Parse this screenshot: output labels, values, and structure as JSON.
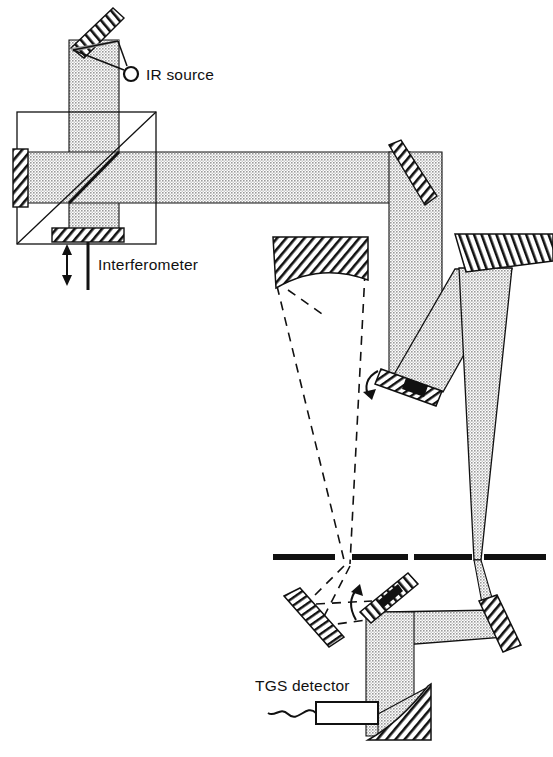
{
  "figure": {
    "type": "optical-ray-diagram",
    "background_color": "#ffffff",
    "ink_color": "#111111",
    "beam_fill_color": "#b0b0b0",
    "mirror_hatch_color": "#111111"
  },
  "labels": {
    "ir_source": "IR source",
    "interferometer": "Interferometer",
    "tgs_detector": "TGS detector"
  },
  "components": {
    "ir_source": {
      "name": "IR source",
      "kind": "point-source",
      "marker": "open-circle",
      "x": 131,
      "y": 74,
      "radius": 6
    },
    "source_collimating_mirror": {
      "name": "source collimating mirror",
      "kind": "flat-mirror-hatched",
      "angle_deg": -38,
      "x": 96,
      "y": 22
    },
    "beamsplitter_cube": {
      "name": "beamsplitter",
      "kind": "square-outline-with-diagonal",
      "x": 17,
      "y": 112,
      "width": 139,
      "height": 132
    },
    "fixed_mirror": {
      "name": "fixed mirror",
      "kind": "flat-mirror-hatched",
      "orientation": "vertical",
      "x": 18,
      "y": 152
    },
    "moving_mirror": {
      "name": "moving mirror",
      "kind": "flat-mirror-hatched",
      "orientation": "horizontal",
      "x": 56,
      "y": 231,
      "travel_arrow": "double-headed-vertical"
    },
    "fold_mirror_top_right": {
      "name": "45 degree fold mirror",
      "kind": "flat-mirror-hatched",
      "angle_deg": 45,
      "x": 396,
      "y": 145
    },
    "collimator_mirror_left": {
      "name": "concave collimating mirror",
      "kind": "concave-mirror-hatched",
      "x": 273,
      "y": 236,
      "width": 95,
      "height": 50
    },
    "parabolic_mirror_right": {
      "name": "off-axis focusing mirror",
      "kind": "flat-mirror-hatched",
      "x": 455,
      "y": 233,
      "width": 98,
      "height": 36
    },
    "chopper_mirror_upper": {
      "name": "rotating selector mirror upper",
      "kind": "flat-mirror-hatched",
      "angle_deg": 28,
      "x": 385,
      "y": 372,
      "rotation_arrow": true
    },
    "chopper_mirror_lower": {
      "name": "rotating selector mirror lower",
      "kind": "flat-mirror-hatched",
      "angle_deg": -35,
      "x": 390,
      "y": 600,
      "rotation_arrow": true
    },
    "sample_mirror_left": {
      "name": "sample channel mirror",
      "kind": "flat-mirror-hatched",
      "angle_deg": 35,
      "x": 300,
      "y": 620
    },
    "fold_mirror_lower_right": {
      "name": "lower fold mirror",
      "kind": "flat-mirror-hatched",
      "angle_deg": 55,
      "x": 495,
      "y": 620
    },
    "detector_focus_mirror": {
      "name": "detector focusing mirror",
      "kind": "concave-mirror-hatched",
      "x": 390,
      "y": 700
    },
    "tgs_detector": {
      "name": "TGS detector",
      "kind": "rectangular-detector-with-lead",
      "x": 318,
      "y": 703,
      "width": 60,
      "height": 21
    },
    "focal_slit_left": {
      "name": "left focal plane slit",
      "kind": "aperture-bars",
      "x": 330,
      "y": 557
    },
    "focal_slit_right": {
      "name": "right focal plane slit",
      "kind": "aperture-bars",
      "x": 462,
      "y": 557
    }
  },
  "beams": {
    "solid_beam": {
      "name": "primary beam path",
      "style": "solid filled",
      "fill": "#b0b0b0"
    },
    "dashed_beam": {
      "name": "alternate reference beam path",
      "style": "dashed outline"
    }
  }
}
